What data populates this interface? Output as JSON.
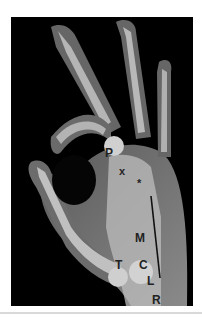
{
  "image": {
    "description": "Lateral radiograph of hand making an OK gesture with labeled carpal/hand bones",
    "labels": [
      {
        "id": "P",
        "text": "P",
        "x": 105,
        "y": 147
      },
      {
        "id": "x",
        "text": "x",
        "x": 117,
        "y": 165
      },
      {
        "id": "star",
        "text": "*",
        "x": 136,
        "y": 176
      },
      {
        "id": "M",
        "text": "M",
        "x": 136,
        "y": 233
      },
      {
        "id": "T",
        "text": "T",
        "x": 114,
        "y": 260
      },
      {
        "id": "C",
        "text": "C",
        "x": 138,
        "y": 260
      },
      {
        "id": "L",
        "text": "L",
        "x": 146,
        "y": 276
      },
      {
        "id": "R",
        "text": "R",
        "x": 151,
        "y": 295
      }
    ],
    "marker_line": {
      "x1": 151,
      "y1": 196,
      "x2": 160,
      "y2": 278,
      "color": "#111111"
    }
  },
  "colors": {
    "background": "#000000",
    "soft_tissue": "#6e6e6e",
    "bone": "#c8c8c8",
    "label": "#222222"
  }
}
